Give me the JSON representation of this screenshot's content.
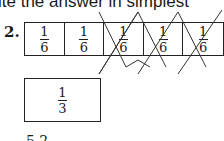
{
  "header": {
    "text": "ite the answer in simplest"
  },
  "problem": {
    "number": "2.",
    "strip": {
      "cells": [
        {
          "numerator": "1",
          "denominator": "6",
          "crossed": false
        },
        {
          "numerator": "1",
          "denominator": "6",
          "crossed": false
        },
        {
          "numerator": "1",
          "denominator": "6",
          "crossed": true
        },
        {
          "numerator": "1",
          "denominator": "6",
          "crossed": true
        },
        {
          "numerator": "1",
          "denominator": "6",
          "crossed": true
        }
      ]
    },
    "answer_box": {
      "numerator": "1",
      "denominator": "3"
    },
    "footer_partial": "5    2"
  }
}
